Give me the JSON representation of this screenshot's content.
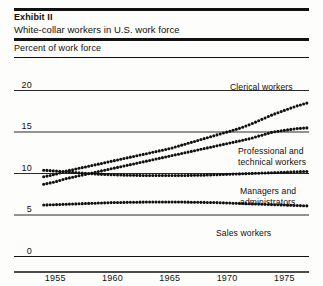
{
  "header": {
    "exhibit_label": "Exhibit II",
    "title": "White-collar workers in U.S. work force",
    "axis_caption": "Percent of work force"
  },
  "chart_data": {
    "type": "line",
    "title": "White-collar workers in U.S. work force",
    "subtitle": "Exhibit II",
    "xlabel": "",
    "ylabel": "Percent of work force",
    "xlim": [
      1953.5,
      1977.5
    ],
    "ylim": [
      0,
      21.5
    ],
    "xticks": [
      "1955",
      "1960",
      "1965",
      "1970",
      "1975"
    ],
    "xtick_values": [
      1955,
      1960,
      1965,
      1970,
      1975
    ],
    "yticks": [
      "0",
      "5",
      "10",
      "15",
      "20"
    ],
    "ytick_values": [
      0,
      5,
      10,
      15,
      20
    ],
    "grid": "horizontal",
    "legend": "inline-right-labels",
    "marker": "dotted",
    "x": [
      1954,
      1955,
      1956,
      1957,
      1958,
      1959,
      1960,
      1961,
      1962,
      1963,
      1964,
      1965,
      1966,
      1967,
      1968,
      1969,
      1970,
      1971,
      1972,
      1973,
      1974,
      1975,
      1976,
      1977
    ],
    "series": [
      {
        "name": "Clerical workers",
        "label": "Clerical workers",
        "values": [
          9.6,
          9.9,
          10.3,
          10.6,
          10.9,
          11.2,
          11.5,
          11.8,
          12.1,
          12.4,
          12.7,
          13.0,
          13.4,
          13.8,
          14.2,
          14.6,
          15.0,
          15.4,
          15.9,
          16.5,
          17.1,
          17.6,
          18.1,
          18.5
        ]
      },
      {
        "name": "Professional and technical workers",
        "label": "Professional and technical workers",
        "values": [
          8.7,
          9.0,
          9.4,
          9.7,
          10.0,
          10.3,
          10.6,
          10.9,
          11.2,
          11.5,
          11.8,
          12.1,
          12.4,
          12.7,
          13.0,
          13.3,
          13.6,
          13.9,
          14.2,
          14.6,
          15.0,
          15.2,
          15.4,
          15.5
        ]
      },
      {
        "name": "Managers and administrators",
        "label": "Managers and administrators",
        "values": [
          10.4,
          10.3,
          10.2,
          10.1,
          10.0,
          9.9,
          9.85,
          9.8,
          9.78,
          9.76,
          9.75,
          9.75,
          9.76,
          9.78,
          9.8,
          9.85,
          9.9,
          9.95,
          10.0,
          10.05,
          10.1,
          10.15,
          10.2,
          10.25
        ]
      },
      {
        "name": "Sales workers",
        "label": "Sales workers",
        "values": [
          6.2,
          6.25,
          6.3,
          6.35,
          6.4,
          6.45,
          6.5,
          6.52,
          6.54,
          6.56,
          6.57,
          6.57,
          6.56,
          6.54,
          6.52,
          6.5,
          6.45,
          6.4,
          6.35,
          6.3,
          6.25,
          6.2,
          6.15,
          6.1
        ]
      }
    ]
  },
  "labels": {
    "clerical": "Clerical workers",
    "professional_line1": "Professional and",
    "professional_line2": "technical workers",
    "managers_line1": "Managers and",
    "managers_line2": "administrators",
    "sales": "Sales workers"
  },
  "colors": {
    "ink": "#111111",
    "rule": "#111111",
    "background": "#fdfdfb"
  }
}
